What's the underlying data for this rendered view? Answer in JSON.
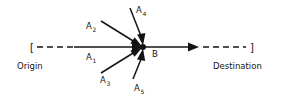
{
  "diagram": {
    "background_color": "#ffffff",
    "stroke_color": "#141414",
    "axis": {
      "origin_bracket": "[",
      "destination_bracket": "]",
      "origin_label": "Origin",
      "destination_label": "Destination",
      "node_label": "B"
    },
    "vectors": [
      {
        "id": "A1",
        "label": "A",
        "subscript": "1",
        "direction": "from-left-horizontal"
      },
      {
        "id": "A2",
        "label": "A",
        "subscript": "2",
        "direction": "from-upper-left"
      },
      {
        "id": "A3",
        "label": "A",
        "subscript": "3",
        "direction": "from-lower-left"
      },
      {
        "id": "A4",
        "label": "A",
        "subscript": "4",
        "direction": "from-above"
      },
      {
        "id": "A5",
        "label": "A",
        "subscript": "5",
        "direction": "from-below"
      }
    ]
  }
}
